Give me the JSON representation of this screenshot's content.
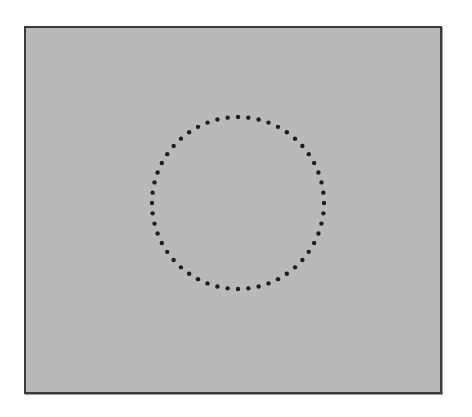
{
  "figure": {
    "background_color": "#ffffff",
    "panel": {
      "fill_color": "#b9b9b9",
      "border_color": "#3a3a3a"
    },
    "dotted_circle": {
      "center_x": 238,
      "center_y": 203,
      "radius": 86,
      "dot_count": 52,
      "dot_radius": 2.2,
      "dot_color": "#1e1e1e"
    }
  }
}
